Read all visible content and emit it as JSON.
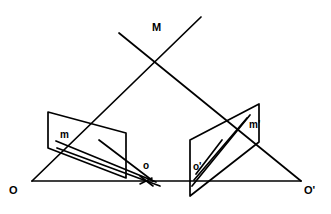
{
  "figure": {
    "kind": "projective-geometry-diagram",
    "stroke_color": "#000000",
    "background_color": "#ffffff",
    "stroke_width": 1.6,
    "labels": [
      {
        "id": "M",
        "text": "M",
        "x": 152,
        "y": 22,
        "size": "lbl-lg"
      },
      {
        "id": "m",
        "text": "m",
        "x": 60,
        "y": 133,
        "size": "lbl-md"
      },
      {
        "id": "o",
        "text": "o",
        "x": 143,
        "y": 163,
        "size": "lbl-md"
      },
      {
        "id": "O",
        "text": "O",
        "x": 9,
        "y": 185,
        "size": "lbl-lg"
      },
      {
        "id": "mp",
        "text": "m'",
        "x": 250,
        "y": 122,
        "size": "lbl-md"
      },
      {
        "id": "op",
        "text": "o'",
        "x": 194,
        "y": 164,
        "size": "lbl-md"
      },
      {
        "id": "Op",
        "text": "O'",
        "x": 305,
        "y": 185,
        "size": "lbl-lg"
      }
    ],
    "shapes": {
      "baseline": {
        "name": "baseline-O-Oprime",
        "x1": 32,
        "y1": 181,
        "x2": 301,
        "y2": 181
      },
      "triangle_left_side": {
        "name": "triangle-side-O-M",
        "x1": 32,
        "y1": 181,
        "x2": 200,
        "y2": 18
      },
      "triangle_right_side": {
        "name": "triangle-side-M-Oprime",
        "x1": 120,
        "y1": 35,
        "x2": 301,
        "y2": 181
      },
      "left_plane": {
        "name": "left-plane-parallelogram",
        "points": "48,112 126,133 126,178 48,148"
      },
      "right_plane": {
        "name": "right-plane-parallelogram",
        "points": "259,104 259,142 190,196 190,140"
      },
      "left_inner_lines": [
        {
          "name": "left-plane-line-m-o-a",
          "x1": 57,
          "y1": 142,
          "x2": 155,
          "y2": 181
        },
        {
          "name": "left-plane-line-m-o-b",
          "x1": 58,
          "y1": 148,
          "x2": 158,
          "y2": 184
        },
        {
          "name": "left-plane-line-diagonal",
          "x1": 100,
          "y1": 141,
          "x2": 152,
          "y2": 180
        }
      ],
      "right_inner_lines": [
        {
          "name": "right-plane-line-o-m-a",
          "x1": 192,
          "y1": 183,
          "x2": 248,
          "y2": 116
        },
        {
          "name": "right-plane-line-o-m-b",
          "x1": 193,
          "y1": 178,
          "x2": 246,
          "y2": 119
        },
        {
          "name": "right-plane-line-short",
          "x1": 194,
          "y1": 174,
          "x2": 223,
          "y2": 140
        }
      ],
      "arrow_marker": {
        "name": "direction-arrowhead",
        "x": 152,
        "y": 180
      }
    }
  }
}
